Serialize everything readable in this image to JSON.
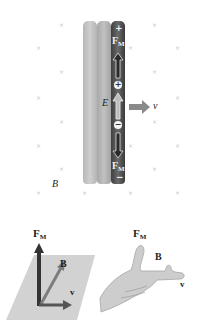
{
  "figure": {
    "top_panel": {
      "labels": {
        "plus_top": "+",
        "fm_top": "F",
        "fm_top_sub": "M",
        "positive_charge": "+",
        "negative_charge": "−",
        "electric_field": "E",
        "velocity": "v",
        "fm_bottom": "F",
        "fm_bottom_sub": "M",
        "minus_bottom": "−",
        "magnetic_field": "B"
      },
      "field_marks_glyph": "×",
      "colors": {
        "rod_light": "#c2c2c2",
        "rod_medium": "#b0b0b0",
        "rod_dark": "#4a4a4a",
        "arrow_gray": "#8a8a8a",
        "field_mark": "#c4c4c4"
      }
    },
    "bottom_left_panel": {
      "labels": {
        "force": "F",
        "force_sub": "M",
        "field": "B",
        "velocity": "v"
      },
      "colors": {
        "plane": "#cfcfcf",
        "force_arrow": "#3a3a3a",
        "field_arrow": "#8a8a8a",
        "velocity_arrow": "#5a5a5a"
      }
    },
    "bottom_right_panel": {
      "labels": {
        "force": "F",
        "force_sub": "M",
        "field": "B",
        "velocity": "v"
      },
      "icon": "right-hand-rule-hand"
    }
  }
}
